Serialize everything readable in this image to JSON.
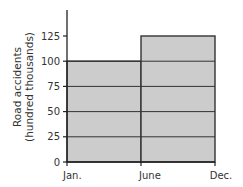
{
  "chart_data": {
    "type": "bar",
    "title": "",
    "xlabel": "",
    "ylabel": "Road accidents (hundred thousands)",
    "ylabel_lines": [
      "Road accidents",
      "(hundred thousands)"
    ],
    "categories": [
      "Jan.–June",
      "June–Dec."
    ],
    "x_tick_labels": [
      "Jan.",
      "June",
      "Dec."
    ],
    "y_tick_labels": [
      "0",
      "25",
      "50",
      "75",
      "100",
      "125"
    ],
    "values": [
      100,
      125
    ],
    "ylim": [
      0,
      150
    ],
    "grid": true,
    "bar_color": "#cccccc",
    "legend": null
  }
}
